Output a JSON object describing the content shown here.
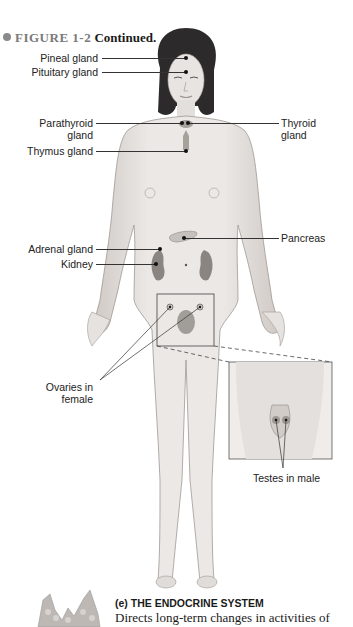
{
  "figure": {
    "number": "FIGURE 1-2",
    "title": "Continued.",
    "colors": {
      "skin": "#e6e2df",
      "skin_shadow": "#bdb6b1",
      "hair": "#2c2a2a",
      "organ": "#9e9894",
      "line": "#333333",
      "header_gray": "#7a7a7a"
    }
  },
  "labels": {
    "pineal": "Pineal gland",
    "pituitary": "Pituitary gland",
    "parathyroid_1": "Parathyroid",
    "parathyroid_2": "gland",
    "thyroid_1": "Thyroid",
    "thyroid_2": "gland",
    "thymus": "Thymus gland",
    "pancreas": "Pancreas",
    "adrenal": "Adrenal gland",
    "kidney": "Kidney",
    "ovaries_1": "Ovaries in",
    "ovaries_2": "female",
    "testes": "Testes in male"
  },
  "caption": {
    "title": "(e) THE ENDOCRINE SYSTEM",
    "body": "Directs long-term changes in activities of"
  },
  "icons": {
    "bullet": "gray-circle-bullet",
    "thumbnail": "thyroid-gland-icon"
  }
}
